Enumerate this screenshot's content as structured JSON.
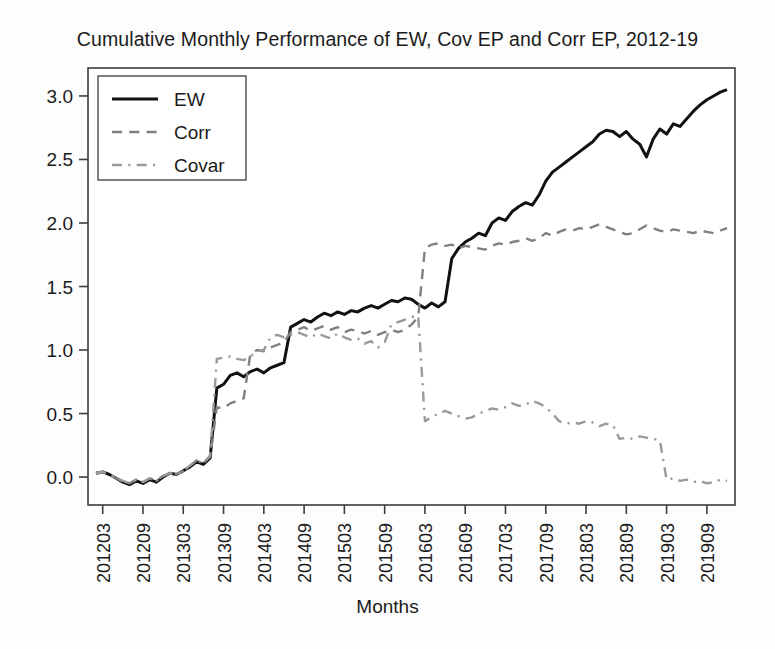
{
  "chart_data": {
    "type": "line",
    "title": "Cumulative Monthly Performance of EW, Cov EP and Corr EP, 2012-19",
    "xlabel": "Months",
    "ylabel": "",
    "grid": false,
    "legend_position": "top-left",
    "ylim": [
      -0.22,
      3.22
    ],
    "ytick_labels": [
      "0.0",
      "0.5",
      "1.0",
      "1.5",
      "2.0",
      "2.5",
      "3.0"
    ],
    "yticks": [
      0.0,
      0.5,
      1.0,
      1.5,
      2.0,
      2.5,
      3.0
    ],
    "xtick_labels": [
      "201203",
      "201209",
      "201303",
      "201309",
      "201403",
      "201409",
      "201503",
      "201509",
      "201603",
      "201609",
      "201703",
      "201709",
      "201803",
      "201809",
      "201903",
      "201909"
    ],
    "xticks": [
      1,
      7,
      13,
      19,
      25,
      31,
      37,
      43,
      49,
      55,
      61,
      67,
      73,
      79,
      85,
      91
    ],
    "x": [
      "201202",
      "201203",
      "201204",
      "201205",
      "201206",
      "201207",
      "201208",
      "201209",
      "201210",
      "201211",
      "201212",
      "201301",
      "201302",
      "201303",
      "201304",
      "201305",
      "201306",
      "201307",
      "201308",
      "201309",
      "201310",
      "201311",
      "201312",
      "201401",
      "201402",
      "201403",
      "201404",
      "201405",
      "201406",
      "201407",
      "201408",
      "201409",
      "201410",
      "201411",
      "201412",
      "201501",
      "201502",
      "201503",
      "201504",
      "201505",
      "201506",
      "201507",
      "201508",
      "201509",
      "201510",
      "201511",
      "201512",
      "201601",
      "201602",
      "201603",
      "201604",
      "201605",
      "201606",
      "201607",
      "201608",
      "201609",
      "201610",
      "201611",
      "201612",
      "201701",
      "201702",
      "201703",
      "201704",
      "201705",
      "201706",
      "201707",
      "201708",
      "201709",
      "201710",
      "201711",
      "201712",
      "201801",
      "201802",
      "201803",
      "201804",
      "201805",
      "201806",
      "201807",
      "201808",
      "201809",
      "201810",
      "201811",
      "201812",
      "201901",
      "201902",
      "201903",
      "201904",
      "201905",
      "201906",
      "201907",
      "201908",
      "201909",
      "201910",
      "201911",
      "201912"
    ],
    "series": [
      {
        "name": "EW",
        "style": "solid",
        "color": "#111111",
        "values": [
          0.03,
          0.04,
          0.02,
          -0.01,
          -0.04,
          -0.06,
          -0.03,
          -0.05,
          -0.02,
          -0.04,
          0.0,
          0.03,
          0.02,
          0.05,
          0.08,
          0.12,
          0.1,
          0.15,
          0.7,
          0.73,
          0.8,
          0.82,
          0.79,
          0.83,
          0.85,
          0.82,
          0.86,
          0.88,
          0.9,
          1.18,
          1.21,
          1.24,
          1.22,
          1.26,
          1.29,
          1.27,
          1.3,
          1.28,
          1.31,
          1.3,
          1.33,
          1.35,
          1.33,
          1.36,
          1.39,
          1.38,
          1.41,
          1.4,
          1.36,
          1.33,
          1.37,
          1.34,
          1.38,
          1.72,
          1.8,
          1.85,
          1.88,
          1.92,
          1.9,
          2.0,
          2.04,
          2.02,
          2.09,
          2.13,
          2.16,
          2.14,
          2.22,
          2.33,
          2.4,
          2.44,
          2.48,
          2.52,
          2.56,
          2.6,
          2.64,
          2.7,
          2.73,
          2.72,
          2.68,
          2.72,
          2.66,
          2.62,
          2.52,
          2.66,
          2.74,
          2.7,
          2.78,
          2.76,
          2.82,
          2.88,
          2.93,
          2.97,
          3.0,
          3.03,
          3.05
        ]
      },
      {
        "name": "Corr",
        "style": "dashed",
        "color": "#808080",
        "values": [
          0.03,
          0.04,
          0.02,
          -0.01,
          -0.03,
          -0.05,
          -0.02,
          -0.04,
          -0.01,
          -0.03,
          0.01,
          0.03,
          0.02,
          0.05,
          0.09,
          0.13,
          0.11,
          0.16,
          0.55,
          0.54,
          0.58,
          0.6,
          0.62,
          0.97,
          1.0,
          0.99,
          1.02,
          1.04,
          1.06,
          1.14,
          1.16,
          1.18,
          1.15,
          1.17,
          1.19,
          1.16,
          1.18,
          1.14,
          1.16,
          1.15,
          1.13,
          1.15,
          1.12,
          1.14,
          1.16,
          1.14,
          1.16,
          1.2,
          1.26,
          1.8,
          1.83,
          1.84,
          1.82,
          1.83,
          1.8,
          1.82,
          1.81,
          1.8,
          1.79,
          1.82,
          1.84,
          1.83,
          1.85,
          1.86,
          1.88,
          1.86,
          1.88,
          1.92,
          1.9,
          1.93,
          1.95,
          1.94,
          1.96,
          1.95,
          1.97,
          1.99,
          1.97,
          1.95,
          1.93,
          1.91,
          1.92,
          1.95,
          1.98,
          1.96,
          1.94,
          1.93,
          1.95,
          1.94,
          1.93,
          1.92,
          1.94,
          1.93,
          1.92,
          1.94,
          1.96
        ]
      },
      {
        "name": "Covar",
        "style": "dashdot",
        "color": "#9a9a9a",
        "values": [
          0.03,
          0.04,
          0.02,
          -0.01,
          -0.03,
          -0.05,
          -0.02,
          -0.04,
          -0.01,
          -0.03,
          0.01,
          0.03,
          0.02,
          0.05,
          0.09,
          0.13,
          0.11,
          0.17,
          0.93,
          0.94,
          0.95,
          0.93,
          0.92,
          0.95,
          0.99,
          1.0,
          1.1,
          1.12,
          1.1,
          1.12,
          1.14,
          1.12,
          1.1,
          1.13,
          1.11,
          1.09,
          1.13,
          1.1,
          1.08,
          1.09,
          1.05,
          1.07,
          1.02,
          1.06,
          1.2,
          1.22,
          1.24,
          1.26,
          1.27,
          0.44,
          0.47,
          0.5,
          0.52,
          0.5,
          0.48,
          0.46,
          0.47,
          0.5,
          0.52,
          0.54,
          0.53,
          0.55,
          0.58,
          0.56,
          0.57,
          0.6,
          0.58,
          0.55,
          0.5,
          0.44,
          0.42,
          0.43,
          0.42,
          0.44,
          0.43,
          0.4,
          0.42,
          0.41,
          0.3,
          0.31,
          0.3,
          0.32,
          0.31,
          0.3,
          0.29,
          -0.02,
          -0.01,
          -0.03,
          -0.02,
          -0.04,
          -0.03,
          -0.05,
          -0.04,
          -0.02,
          -0.03
        ]
      }
    ]
  },
  "legend": {
    "entries": [
      {
        "label": "EW",
        "style": "solid"
      },
      {
        "label": "Corr",
        "style": "dashed"
      },
      {
        "label": "Covar",
        "style": "dashdot"
      }
    ]
  },
  "colors": {
    "ew": "#111111",
    "corr": "#808080",
    "covar": "#9a9a9a",
    "axis": "#4a4a4a",
    "background": "#fdfdfd"
  }
}
